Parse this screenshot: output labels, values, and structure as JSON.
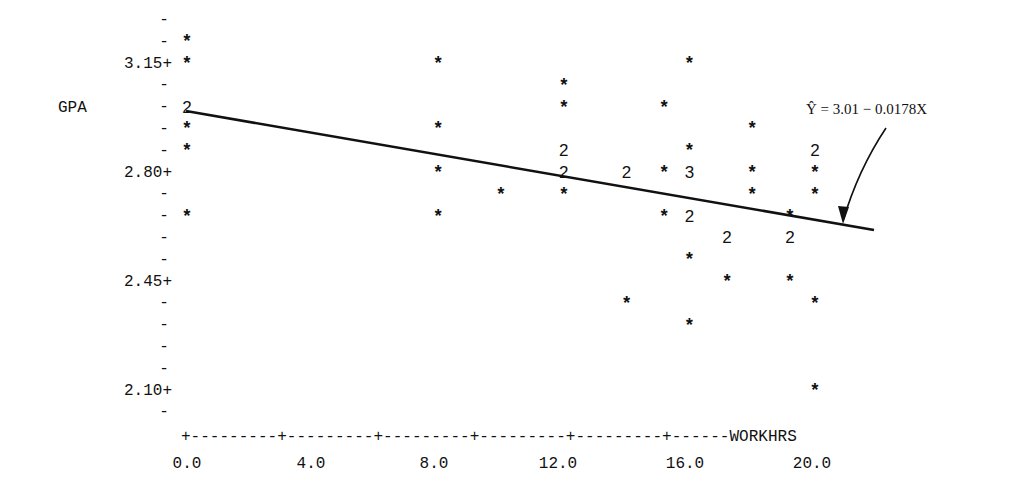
{
  "chart_data": {
    "type": "scatter",
    "title": "",
    "xlabel": "WORKHRS",
    "ylabel": "GPA",
    "x_ticks": [
      "0.0",
      "4.0",
      "8.0",
      "12.0",
      "16.0",
      "20.0"
    ],
    "y_ticks": [
      "3.15+",
      "2.80+",
      "2.45+",
      "2.10+"
    ],
    "xlim": [
      0,
      22
    ],
    "ylim": [
      2.03,
      3.29
    ],
    "grid": false,
    "legend": null,
    "annotation": "Ŷ = 3.01 − 0.0178X",
    "regression_line": {
      "intercept": 3.01,
      "slope": -0.0178,
      "x_range": [
        0,
        22
      ]
    },
    "marker_legend": "* = 1 observation, digit = number of coincident observations",
    "points": [
      {
        "x": 0.0,
        "y": 3.22,
        "count": 1
      },
      {
        "x": 0.0,
        "y": 3.15,
        "count": 1
      },
      {
        "x": 0.0,
        "y": 3.01,
        "count": 2
      },
      {
        "x": 0.0,
        "y": 2.94,
        "count": 1
      },
      {
        "x": 0.0,
        "y": 2.87,
        "count": 1
      },
      {
        "x": 0.0,
        "y": 2.66,
        "count": 1
      },
      {
        "x": 8.0,
        "y": 3.15,
        "count": 1
      },
      {
        "x": 8.0,
        "y": 2.94,
        "count": 1
      },
      {
        "x": 8.0,
        "y": 2.8,
        "count": 1
      },
      {
        "x": 8.0,
        "y": 2.66,
        "count": 1
      },
      {
        "x": 10.0,
        "y": 2.73,
        "count": 1
      },
      {
        "x": 12.0,
        "y": 3.08,
        "count": 1
      },
      {
        "x": 12.0,
        "y": 3.01,
        "count": 1
      },
      {
        "x": 12.0,
        "y": 2.87,
        "count": 2
      },
      {
        "x": 12.0,
        "y": 2.8,
        "count": 2
      },
      {
        "x": 12.0,
        "y": 2.73,
        "count": 1
      },
      {
        "x": 14.0,
        "y": 2.8,
        "count": 2
      },
      {
        "x": 14.0,
        "y": 2.38,
        "count": 1
      },
      {
        "x": 15.2,
        "y": 3.01,
        "count": 1
      },
      {
        "x": 15.2,
        "y": 2.8,
        "count": 1
      },
      {
        "x": 15.2,
        "y": 2.66,
        "count": 1
      },
      {
        "x": 16.0,
        "y": 3.15,
        "count": 1
      },
      {
        "x": 16.0,
        "y": 2.87,
        "count": 1
      },
      {
        "x": 16.0,
        "y": 2.8,
        "count": 3
      },
      {
        "x": 16.0,
        "y": 2.66,
        "count": 2
      },
      {
        "x": 16.0,
        "y": 2.52,
        "count": 1
      },
      {
        "x": 16.0,
        "y": 2.31,
        "count": 1
      },
      {
        "x": 17.2,
        "y": 2.59,
        "count": 2
      },
      {
        "x": 17.2,
        "y": 2.45,
        "count": 1
      },
      {
        "x": 18.0,
        "y": 2.94,
        "count": 1
      },
      {
        "x": 18.0,
        "y": 2.8,
        "count": 1
      },
      {
        "x": 18.0,
        "y": 2.73,
        "count": 1
      },
      {
        "x": 19.2,
        "y": 2.66,
        "count": 1
      },
      {
        "x": 19.2,
        "y": 2.59,
        "count": 2
      },
      {
        "x": 19.2,
        "y": 2.45,
        "count": 1
      },
      {
        "x": 20.0,
        "y": 2.87,
        "count": 2
      },
      {
        "x": 20.0,
        "y": 2.8,
        "count": 1
      },
      {
        "x": 20.0,
        "y": 2.73,
        "count": 1
      },
      {
        "x": 20.0,
        "y": 2.38,
        "count": 1
      },
      {
        "x": 20.0,
        "y": 2.1,
        "count": 1
      }
    ]
  },
  "axis": {
    "y_label": "GPA",
    "x_label": "WORKHRS",
    "y_tick_labels": [
      "3.15+",
      "2.80+",
      "2.45+",
      "2.10+"
    ],
    "x_tick_labels": [
      "0.0",
      "4.0",
      "8.0",
      "12.0",
      "16.0",
      "20.0"
    ],
    "x_axis_line": "+---------+---------+---------+---------+---------+------WORKHRS",
    "minor_tick": "-",
    "star": "*"
  },
  "annotation": {
    "equation": "Ŷ = 3.01 − 0.0178X"
  }
}
